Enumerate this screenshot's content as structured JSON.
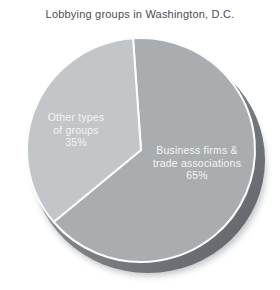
{
  "chart_data": {
    "type": "pie",
    "title": "Lobbying groups in Washington, D.C.",
    "style": "3d-pie",
    "legend": "none",
    "start_angle_deg": -4,
    "slices": [
      {
        "label": "Business firms & trade associations",
        "value": 65,
        "percent_label": "65%",
        "color": "#a9adb0",
        "label_lines": [
          "Business firms &",
          "trade associations",
          "65%"
        ],
        "label_x": 197,
        "label_y": 154
      },
      {
        "label": "Other types of groups",
        "value": 35,
        "percent_label": "35%",
        "color": "#c3c6c8",
        "label_lines": [
          "Other types",
          "of groups",
          "35%"
        ],
        "label_x": 76,
        "label_y": 121
      }
    ],
    "colors": {
      "background": "#ffffff",
      "title_text": "#4a4e52",
      "slice_label_text": "#f2f4f4",
      "divider": "#fcfdfd",
      "depth_shadow_dark": "#606468",
      "depth_shadow_light": "#9ba0a4",
      "soft_shadow": "#c2c6c9"
    }
  }
}
